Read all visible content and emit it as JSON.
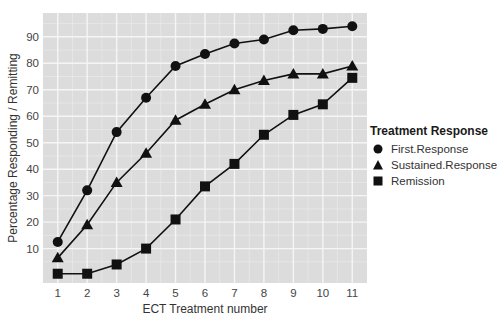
{
  "chart_data": {
    "type": "line",
    "title": "",
    "xlabel": "ECT Treatment number",
    "ylabel": "Percentage Responding / Remitting",
    "x": [
      1,
      2,
      3,
      4,
      5,
      6,
      7,
      8,
      9,
      10,
      11
    ],
    "x_ticks": [
      "1",
      "2",
      "3",
      "4",
      "5",
      "6",
      "7",
      "8",
      "9",
      "10",
      "11"
    ],
    "y_ticks": [
      "10",
      "20",
      "30",
      "40",
      "50",
      "60",
      "70",
      "80",
      "90"
    ],
    "ylim": [
      -3,
      99
    ],
    "xlim": [
      0.5,
      11.5
    ],
    "grid": true,
    "legend_position": "right",
    "legend_title": "Treatment Response",
    "series": [
      {
        "name": "First.Response",
        "marker": "circle",
        "values": [
          12.5,
          32,
          54,
          67,
          79,
          83.5,
          87.5,
          89,
          92.5,
          93,
          94
        ]
      },
      {
        "name": "Sustained.Response",
        "marker": "triangle",
        "values": [
          6.5,
          19,
          35,
          46,
          58.5,
          64.5,
          70,
          73.5,
          76,
          76,
          79
        ]
      },
      {
        "name": "Remission",
        "marker": "square",
        "values": [
          0.5,
          0.5,
          4,
          10,
          21,
          33.5,
          42,
          53,
          60.5,
          64.5,
          74.5
        ]
      }
    ]
  },
  "colors": {
    "panel_bg": "#dcdcdc",
    "grid_major": "#f5f5f5",
    "grid_minor": "#e8e8e8",
    "series": "#111111"
  }
}
